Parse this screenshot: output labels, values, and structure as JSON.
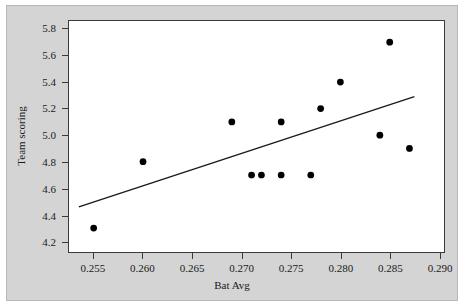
{
  "figure": {
    "mat_color": "#d4d4d4",
    "plot_background": "#ffffff",
    "frame_color": "#3a3a3a",
    "marker_color": "#000000",
    "line_color": "#1a1a1a"
  },
  "chart_data": {
    "type": "scatter",
    "title": "",
    "xlabel": "Bat Avg",
    "ylabel": "Team scoring",
    "xlim": [
      0.2525,
      0.2905
    ],
    "ylim": [
      4.12,
      5.86
    ],
    "grid": false,
    "legend": null,
    "xticks": [
      0.255,
      0.26,
      0.265,
      0.27,
      0.275,
      0.28,
      0.285,
      0.29
    ],
    "xtick_labels": [
      "0.255",
      "0.260",
      "0.265",
      "0.270",
      "0.275",
      "0.280",
      "0.285",
      "0.290"
    ],
    "yticks": [
      4.2,
      4.4,
      4.6,
      4.8,
      5.0,
      5.2,
      5.4,
      5.6,
      5.8
    ],
    "ytick_labels": [
      "4.2",
      "4.4",
      "4.6",
      "4.8",
      "5.0",
      "5.2",
      "5.4",
      "5.6",
      "5.8"
    ],
    "points": [
      {
        "x": 0.255,
        "y": 4.3
      },
      {
        "x": 0.26,
        "y": 4.8
      },
      {
        "x": 0.269,
        "y": 5.1
      },
      {
        "x": 0.271,
        "y": 4.7
      },
      {
        "x": 0.272,
        "y": 4.7
      },
      {
        "x": 0.274,
        "y": 5.1
      },
      {
        "x": 0.274,
        "y": 4.7
      },
      {
        "x": 0.277,
        "y": 4.7
      },
      {
        "x": 0.278,
        "y": 5.2
      },
      {
        "x": 0.28,
        "y": 5.4
      },
      {
        "x": 0.284,
        "y": 5.0
      },
      {
        "x": 0.285,
        "y": 5.7
      },
      {
        "x": 0.287,
        "y": 4.9
      }
    ],
    "marker_radius_px": 3.4,
    "fit_line": {
      "name": "regression-line",
      "x0": 0.2535,
      "y0": 4.46,
      "x1": 0.2875,
      "y1": 5.29,
      "width_px": 1.4
    }
  }
}
